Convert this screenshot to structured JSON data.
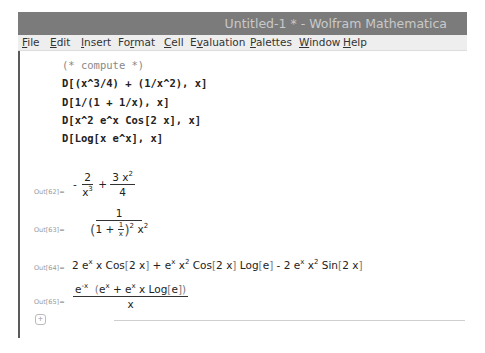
{
  "window": {
    "title": "Untitled-1 * - Wolfram Mathematica",
    "titlebar_color": "#7b7b7b"
  },
  "menubar": {
    "items": [
      {
        "label": "File",
        "mnemonic": "F"
      },
      {
        "label": "Edit",
        "mnemonic": "E"
      },
      {
        "label": "Insert",
        "mnemonic": "I"
      },
      {
        "label": "Format",
        "mnemonic": "r"
      },
      {
        "label": "Cell",
        "mnemonic": "C"
      },
      {
        "label": "Evaluation",
        "mnemonic": "v"
      },
      {
        "label": "Palettes",
        "mnemonic": "P"
      },
      {
        "label": "Window",
        "mnemonic": "W"
      },
      {
        "label": "Help",
        "mnemonic": "H"
      }
    ]
  },
  "input_cell": {
    "lines": [
      "(* compute *)",
      "D[(x^3/4) + (1/x^2), x]",
      "D[1/(1 + 1/x), x]",
      "D[x^2 e^x Cos[2 x], x]",
      "D[Log[x e^x], x]"
    ]
  },
  "outputs": [
    {
      "label": "Out[62]=",
      "expr": "-2/x^3 + 3 x^2/4"
    },
    {
      "label": "Out[63]=",
      "expr": "1/((1 + 1/x)^2 x^2)"
    },
    {
      "label": "Out[64]=",
      "expr": "2 e^x x Cos[2 x] + e^x x^2 Cos[2 x] Log[e] - 2 e^x x^2 Sin[2 x]"
    },
    {
      "label": "Out[65]=",
      "expr": "e^-x (e^x + e^x x Log[e]) / x"
    }
  ],
  "tokens": {
    "minus": "-",
    "plus": "+",
    "two": "2",
    "three": "3",
    "four": "4",
    "one": "1",
    "x": "x",
    "e": "e",
    "cos": "Cos",
    "sin": "Sin",
    "log": "Log",
    "lb": "[",
    "rb": "]",
    "lp": "(",
    "rp": ")",
    "neg_x": "-x",
    "plus_cell": "+"
  }
}
